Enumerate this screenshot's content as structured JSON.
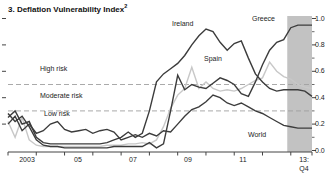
{
  "header": {
    "title": "3. Deflation Vulnerability Index",
    "title_superscript": "2"
  },
  "chart_data": {
    "type": "line",
    "title": "3. Deflation Vulnerability Index",
    "x_unit": "quarterly",
    "x_start": "2003:Q1",
    "x_end": "2013:Q4",
    "ylim": [
      0.0,
      1.0
    ],
    "grid": "off",
    "y_axis": {
      "side": "right",
      "labels": [
        "1.0",
        "0.8",
        "0.6",
        "0.4",
        "0.2",
        "0.0"
      ],
      "values": [
        1.0,
        0.8,
        0.6,
        0.4,
        0.2,
        0.0
      ],
      "minor_tick_step": 0.1
    },
    "x_axis": {
      "labels": [
        "2003",
        "05",
        "07",
        "09",
        "11"
      ],
      "label_centers_px": [
        27,
        78,
        133,
        188,
        243
      ],
      "last_label_line1": "13:",
      "last_label_line2": "Q4",
      "year_ticks": [
        2003,
        2004,
        2005,
        2006,
        2007,
        2008,
        2009,
        2010,
        2011,
        2012,
        2013
      ]
    },
    "threshold_lines": [
      {
        "value": 0.5,
        "style": "dashed"
      },
      {
        "value": 0.3,
        "style": "dashed"
      }
    ],
    "threshold_labels": {
      "high": "High risk",
      "moderate": "Moderate risk",
      "low": "Low risk"
    },
    "forecast_band": {
      "start": "2013:Q1",
      "start_index": 39.5,
      "color": "#c2c2c2"
    },
    "colors": {
      "dark_line": "#3c3c3c",
      "light_line": "#c8c8c8",
      "dashed_line": "#a0a0a0",
      "axis": "#444444",
      "text": "#1c1c1c"
    },
    "series": [
      {
        "name": "Ireland",
        "color": "#3c3c3c",
        "values": [
          0.25,
          0.3,
          0.2,
          0.22,
          0.1,
          0.06,
          0.05,
          0.05,
          0.05,
          0.05,
          0.05,
          0.05,
          0.05,
          0.05,
          0.06,
          0.08,
          0.1,
          0.14,
          0.1,
          0.13,
          0.3,
          0.52,
          0.58,
          0.62,
          0.66,
          0.72,
          0.8,
          0.87,
          0.92,
          0.9,
          0.82,
          0.76,
          0.81,
          0.83,
          0.7,
          0.58,
          0.52,
          0.47,
          0.45,
          0.46,
          0.46,
          0.46,
          0.45,
          0.41
        ]
      },
      {
        "name": "Spain",
        "color": "#c8c8c8",
        "values": [
          0.22,
          0.1,
          0.25,
          0.08,
          0.04,
          0.03,
          0.03,
          0.03,
          0.03,
          0.03,
          0.03,
          0.03,
          0.03,
          0.03,
          0.04,
          0.04,
          0.04,
          0.05,
          0.05,
          0.06,
          0.05,
          0.08,
          0.18,
          0.32,
          0.42,
          0.47,
          0.63,
          0.47,
          0.52,
          0.47,
          0.45,
          0.46,
          0.45,
          0.47,
          0.5,
          0.53,
          0.55,
          0.67,
          0.6,
          0.56,
          0.54,
          0.5,
          0.48,
          0.47
        ]
      },
      {
        "name": "Greece",
        "color": "#3c3c3c",
        "values": [
          0.28,
          0.22,
          0.26,
          0.18,
          0.08,
          0.04,
          0.03,
          0.03,
          0.02,
          0.02,
          0.02,
          0.02,
          0.02,
          0.02,
          0.02,
          0.03,
          0.03,
          0.03,
          0.03,
          0.03,
          0.06,
          0.02,
          0.05,
          0.3,
          0.57,
          0.46,
          0.5,
          0.48,
          0.47,
          0.51,
          0.55,
          0.53,
          0.5,
          0.43,
          0.41,
          0.52,
          0.65,
          0.76,
          0.82,
          0.84,
          0.93,
          0.95,
          0.95,
          0.95
        ]
      },
      {
        "name": "World",
        "color": "#3c3c3c",
        "values": [
          0.2,
          0.26,
          0.15,
          0.2,
          0.13,
          0.15,
          0.2,
          0.22,
          0.16,
          0.14,
          0.15,
          0.16,
          0.13,
          0.15,
          0.16,
          0.14,
          0.08,
          0.1,
          0.12,
          0.1,
          0.13,
          0.11,
          0.15,
          0.14,
          0.2,
          0.26,
          0.31,
          0.33,
          0.37,
          0.42,
          0.4,
          0.36,
          0.34,
          0.36,
          0.33,
          0.3,
          0.28,
          0.25,
          0.22,
          0.19,
          0.18,
          0.17,
          0.17,
          0.17
        ]
      }
    ]
  }
}
